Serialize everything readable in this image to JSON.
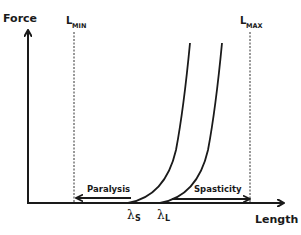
{
  "diagram": {
    "type": "force-length",
    "axes": {
      "y_label": "Force",
      "x_label": "Length"
    },
    "bounds": {
      "min": {
        "label_main": "L",
        "label_sub": "MIN"
      },
      "max": {
        "label_main": "L",
        "label_sub": "MAX"
      }
    },
    "thresholds": {
      "short": {
        "symbol": "λ",
        "sub": "S"
      },
      "long": {
        "symbol": "λ",
        "sub": "L"
      }
    },
    "regions": {
      "left": "Paralysis",
      "right": "Spasticity"
    },
    "colors": {
      "ink": "#1a1a1a",
      "background": "#ffffff"
    }
  }
}
